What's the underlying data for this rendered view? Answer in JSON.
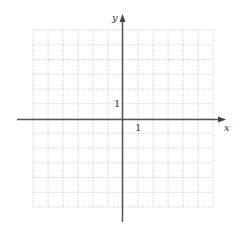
{
  "diagram": {
    "type": "coordinate-grid",
    "x_axis_label": "x",
    "y_axis_label": "y",
    "x_tick_label": "1",
    "y_tick_label": "1",
    "grid": {
      "columns": 12,
      "rows": 12,
      "style": "dotted"
    },
    "colors": {
      "axis": "#555555",
      "grid": "#bbbbbb",
      "text": "#333333"
    }
  }
}
